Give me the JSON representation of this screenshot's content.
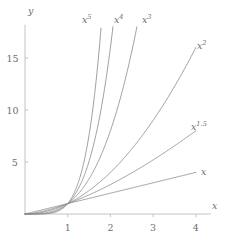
{
  "chart_data": {
    "type": "line",
    "title": "",
    "subtitle": "",
    "xlabel": "x",
    "ylabel": "y",
    "xlim": [
      0,
      4.35
    ],
    "ylim": [
      0,
      18.2
    ],
    "xticks": [
      1,
      2,
      3,
      4
    ],
    "xticklabels": [
      "1",
      "2",
      "3",
      "4"
    ],
    "yticks": [
      5,
      10,
      15
    ],
    "yticklabels": [
      "5",
      "10",
      "15"
    ],
    "grid": false,
    "legend": "inline-curve-labels",
    "line_color": "#8c8c8c",
    "axis_color": "#bdbdbd",
    "text_color": "#6e6e6e",
    "series": [
      {
        "name": "x",
        "label": "x",
        "exponent": 1,
        "label_base": "x",
        "label_exp": "",
        "x": [
          0,
          0.5,
          1,
          1.5,
          2,
          2.5,
          3,
          3.5,
          4
        ],
        "values": [
          0,
          0.5,
          1,
          1.5,
          2,
          2.5,
          3,
          3.5,
          4
        ]
      },
      {
        "name": "x^1.5",
        "label": "x1.5",
        "exponent": 1.5,
        "label_base": "x",
        "label_exp": "1.5",
        "x": [
          0,
          0.5,
          1,
          1.5,
          2,
          2.5,
          3,
          3.5,
          4
        ],
        "values": [
          0,
          0.354,
          1,
          1.837,
          2.828,
          3.953,
          5.196,
          6.548,
          8
        ]
      },
      {
        "name": "x^2",
        "label": "x2",
        "exponent": 2,
        "label_base": "x",
        "label_exp": "2",
        "x": [
          0,
          0.5,
          1,
          1.5,
          2,
          2.5,
          3,
          3.5,
          4
        ],
        "values": [
          0,
          0.25,
          1,
          2.25,
          4,
          6.25,
          9,
          12.25,
          16
        ]
      },
      {
        "name": "x^3",
        "label": "x3",
        "exponent": 3,
        "label_base": "x",
        "label_exp": "3",
        "x": [
          0,
          0.5,
          1,
          1.5,
          2,
          2.5,
          2.62
        ],
        "values": [
          0,
          0.125,
          1,
          3.375,
          8,
          15.625,
          18
        ]
      },
      {
        "name": "x^4",
        "label": "x4",
        "exponent": 4,
        "label_base": "x",
        "label_exp": "4",
        "x": [
          0,
          0.5,
          1,
          1.5,
          2,
          2.06
        ],
        "values": [
          0,
          0.0625,
          1,
          5.0625,
          16,
          18
        ]
      },
      {
        "name": "x^5",
        "label": "x5",
        "exponent": 5,
        "label_base": "x",
        "label_exp": "5",
        "x": [
          0,
          0.5,
          1,
          1.5,
          1.78
        ],
        "values": [
          0,
          0.03125,
          1,
          7.594,
          18
        ]
      }
    ]
  },
  "axis": {
    "x_name": "x",
    "y_name": "y"
  },
  "curve_labels": [
    {
      "base": "x",
      "exp": "5",
      "left": 82,
      "top": 15
    },
    {
      "base": "x",
      "exp": "4",
      "left": 114,
      "top": 15
    },
    {
      "base": "x",
      "exp": "3",
      "left": 142,
      "top": 15
    },
    {
      "base": "x",
      "exp": "2",
      "left": 197,
      "top": 41
    },
    {
      "base": "x",
      "exp": "1.5",
      "left": 191,
      "top": 122
    },
    {
      "base": "x",
      "exp": "",
      "left": 201,
      "top": 167
    }
  ]
}
